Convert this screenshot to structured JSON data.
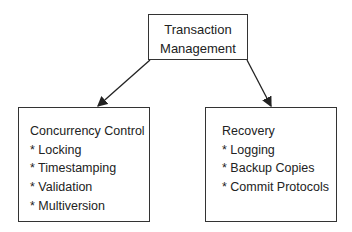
{
  "diagram": {
    "root": {
      "lines": [
        "Transaction",
        "Management"
      ]
    },
    "children": [
      {
        "title": "Concurrency Control",
        "items": [
          "* Locking",
          "* Timestamping",
          "* Validation",
          "* Multiversion"
        ]
      },
      {
        "title": "Recovery",
        "items": [
          "* Logging",
          "* Backup Copies",
          "* Commit Protocols"
        ]
      }
    ],
    "edges": [
      {
        "from": "Transaction Management",
        "to": "Concurrency Control"
      },
      {
        "from": "Transaction Management",
        "to": "Recovery"
      }
    ]
  }
}
